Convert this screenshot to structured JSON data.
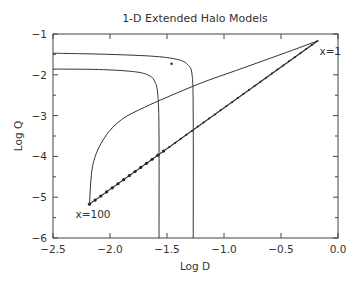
{
  "chart_data": {
    "type": "line",
    "title": "1-D Extended Halo Models",
    "xlabel": "Log D",
    "ylabel": "Log Q",
    "xlim": [
      -2.5,
      0.0
    ],
    "ylim": [
      -6,
      -1
    ],
    "grid": false,
    "x_ticks": [
      "-2.5",
      "-2.0",
      "-1.5",
      "-1.0",
      "-0.5",
      "0.0"
    ],
    "y_ticks": [
      "-1",
      "-2",
      "-3",
      "-4",
      "-5",
      "-6"
    ],
    "annotations": [
      {
        "text": "x=1",
        "x": -0.18,
        "y": -1.17
      },
      {
        "text": "x=100",
        "x": -2.18,
        "y": -5.17
      }
    ],
    "series": [
      {
        "name": "straight line x=100 to x=1 (dotted markers)",
        "x": [
          -2.18,
          -0.18
        ],
        "y": [
          -5.17,
          -1.17
        ]
      },
      {
        "name": "curved line x=100 to x=1",
        "x": [
          -2.18,
          -2.15,
          -2.05,
          -1.9,
          -1.7,
          -1.5,
          -1.2,
          -0.9,
          -0.5,
          -0.18
        ],
        "y": [
          -5.17,
          -4.2,
          -3.55,
          -3.1,
          -2.8,
          -2.55,
          -2.2,
          -1.9,
          -1.5,
          -1.17
        ]
      },
      {
        "name": "upper halo curve",
        "x": [
          -2.5,
          -2.0,
          -1.6,
          -1.4,
          -1.32,
          -1.28,
          -1.27,
          -1.27
        ],
        "y": [
          -1.47,
          -1.5,
          -1.55,
          -1.63,
          -1.75,
          -2.0,
          -3.0,
          -6.0
        ]
      },
      {
        "name": "lower halo curve",
        "x": [
          -2.5,
          -2.1,
          -1.8,
          -1.67,
          -1.61,
          -1.58,
          -1.57,
          -1.57
        ],
        "y": [
          -1.86,
          -1.87,
          -1.92,
          -2.0,
          -2.15,
          -2.5,
          -3.5,
          -6.0
        ]
      },
      {
        "name": "isolated point",
        "x": [
          -1.46
        ],
        "y": [
          -1.73
        ]
      }
    ]
  }
}
